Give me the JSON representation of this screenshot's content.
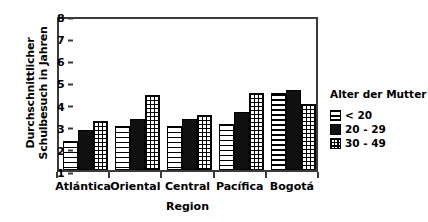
{
  "chart_data": {
    "type": "bar",
    "title": "",
    "xlabel": "Region",
    "ylabel": "Durchschnittlicher\nSchulbesuch in Jahren",
    "categories": [
      "Atlántica",
      "Oriental",
      "Central",
      "Pacífica",
      "Bogotá"
    ],
    "series": [
      {
        "name": "< 20",
        "values": [
          2.3,
          3.0,
          3.0,
          3.1,
          4.5
        ]
      },
      {
        "name": "20 - 29",
        "values": [
          2.8,
          3.3,
          3.3,
          3.6,
          4.6
        ]
      },
      {
        "name": "30 - 49",
        "values": [
          3.2,
          4.4,
          3.5,
          4.5,
          4.0
        ]
      }
    ],
    "ylim": [
      1,
      8
    ],
    "yticks": [
      "1",
      "2",
      "3",
      "4",
      "5",
      "6",
      "7",
      "8"
    ],
    "grid": false,
    "legend": {
      "title": "Alter der Mutter",
      "position": "right",
      "entries": [
        "< 20",
        "20 - 29",
        "30 - 49"
      ]
    },
    "patterns": [
      "horizontal-stripes",
      "solid-black",
      "cross-hatch"
    ],
    "colors": {
      "axis": "#3a3a3a",
      "bar_outline": "#000000",
      "series_2_fill": "#101010",
      "background": "#ffffff"
    }
  }
}
